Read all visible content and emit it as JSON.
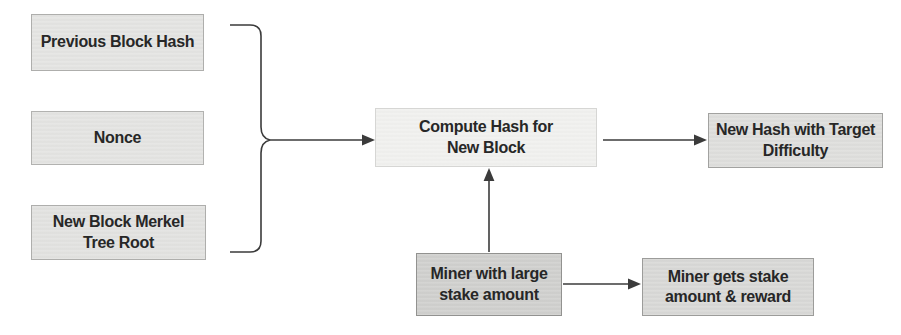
{
  "diagram": {
    "nodes": {
      "previous_block_hash": {
        "label": "Previous Block Hash",
        "fill": "#e4e4e2"
      },
      "nonce": {
        "label": "Nonce",
        "fill": "#e4e4e2"
      },
      "merkel_root": {
        "label": "New Block Merkel\nTree Root",
        "fill": "#e2e2e0"
      },
      "compute_hash": {
        "label": "Compute Hash for\nNew Block",
        "fill": "#f1f1ef"
      },
      "new_hash": {
        "label": "New Hash with Target\nDifficulty",
        "fill": "#dededc"
      },
      "miner_stake": {
        "label": "Miner with large\nstake amount",
        "fill": "#cfcfcd"
      },
      "miner_reward": {
        "label": "Miner gets stake\namount & reward",
        "fill": "#d8d8d6"
      }
    },
    "edges": [
      {
        "from": "previous_block_hash",
        "to": "compute_hash",
        "via": "brace"
      },
      {
        "from": "nonce",
        "to": "compute_hash",
        "via": "brace"
      },
      {
        "from": "merkel_root",
        "to": "compute_hash",
        "via": "brace"
      },
      {
        "from": "compute_hash",
        "to": "new_hash"
      },
      {
        "from": "miner_stake",
        "to": "compute_hash"
      },
      {
        "from": "miner_stake",
        "to": "miner_reward"
      }
    ],
    "colors": {
      "line": "#3b3b3b",
      "text": "#272727",
      "background": "#ffffff"
    }
  }
}
